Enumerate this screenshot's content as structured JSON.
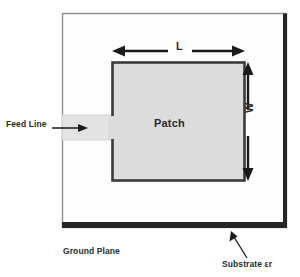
{
  "figure": {
    "background_color": "#ffffff"
  },
  "labels": {
    "feed_line": "Feed Line",
    "patch": "Patch",
    "length": "L",
    "width": "W",
    "ground_plane": "Ground Plane",
    "substrate": "Substrate εr"
  },
  "colors": {
    "substrate_fill": "#fdfdfd",
    "substrate_edge": "#8a8a8a",
    "ground_plane": "#2b2b2b",
    "patch_fill": "#dcdcdc",
    "patch_edge": "#3a3a3a",
    "feed_line_fill": "#e2e2e2",
    "arrow": "#1a1a1a",
    "text": "#2b2b2b"
  },
  "geometry": {
    "substrate": {
      "x": 62,
      "y": 13,
      "width": 225,
      "height": 215
    },
    "patch": {
      "x": 112,
      "y": 62,
      "width": 133,
      "height": 119
    },
    "feed_line": {
      "x": 62,
      "y": 115,
      "width": 52,
      "height": 25
    },
    "ground_plane_band": {
      "x": 62,
      "y": 222,
      "width": 225,
      "height": 6
    }
  },
  "annotations": {
    "length_arrow": {
      "from_x": 114,
      "to_x": 243,
      "y": 51,
      "label": "L"
    },
    "width_arrow": {
      "x": 248,
      "from_y": 64,
      "to_y": 179,
      "label": "W"
    },
    "feed_pointer": {
      "from_x": 52,
      "to_x": 87,
      "y": 128
    },
    "substrate_pointer": {
      "from_x": 246,
      "to_x": 232,
      "from_y": 258,
      "to_y": 233
    }
  },
  "icons": {
    "left_arrow": "arrow-left-icon",
    "right_arrow": "arrow-right-icon",
    "up_arrow": "arrow-up-icon",
    "down_arrow": "arrow-down-icon",
    "pointer_arrow": "arrow-pointer-icon"
  }
}
